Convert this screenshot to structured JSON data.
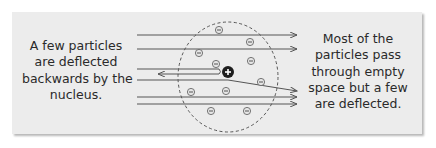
{
  "diagram": {
    "left_caption": {
      "lines": [
        "A few particles",
        "are deflected",
        "backwards by the",
        "nucleus."
      ]
    },
    "right_caption": {
      "lines": [
        "Most of the",
        "particles pass",
        "through empty",
        "space but a few",
        "are deflected."
      ]
    },
    "nucleus": {
      "symbol": "+",
      "label": "nucleus"
    },
    "electron_symbol": "−",
    "colors": {
      "background": "#ececec",
      "line": "#555555",
      "nucleus": "#1e1e1e",
      "text": "#2a2a2a"
    }
  }
}
